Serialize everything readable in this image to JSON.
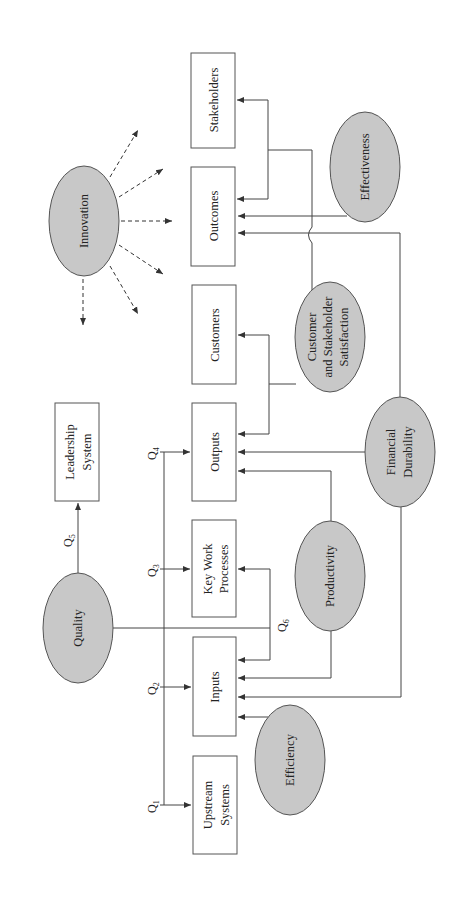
{
  "diagram": {
    "orientation": "rotated -90deg (landscape figure on portrait page)",
    "boxes": {
      "upstream": {
        "line1": "Upstream",
        "line2": "Systems"
      },
      "inputs": {
        "label": "Inputs"
      },
      "kwp": {
        "line1": "Key Work",
        "line2": "Processes"
      },
      "outputs": {
        "label": "Outputs"
      },
      "customers": {
        "label": "Customers"
      },
      "outcomes": {
        "label": "Outcomes"
      },
      "stakeholders": {
        "label": "Stakeholders"
      },
      "leadership": {
        "line1": "Leadership",
        "line2": "System"
      }
    },
    "ellipses": {
      "innovation": {
        "label": "Innovation"
      },
      "quality": {
        "label": "Quality"
      },
      "effectiveness": {
        "label": "Effectiveness"
      },
      "satisfaction": {
        "line1": "Customer",
        "line2": "and Stakeholder",
        "line3": "Satisfaction"
      },
      "financial": {
        "line1": "Financial",
        "line2": "Durability"
      },
      "productivity": {
        "label": "Productivity"
      },
      "efficiency": {
        "label": "Efficiency"
      }
    },
    "q_labels": {
      "q1": {
        "base": "Q",
        "sub": "1"
      },
      "q2": {
        "base": "Q",
        "sub": "2"
      },
      "q3": {
        "base": "Q",
        "sub": "3"
      },
      "q4": {
        "base": "Q",
        "sub": "4"
      },
      "q5": {
        "base": "Q",
        "sub": "5"
      },
      "q6": {
        "base": "Q",
        "sub": "6"
      }
    },
    "colors": {
      "ellipse_fill": "#c8c8c8",
      "stroke": "#555555",
      "background": "#ffffff"
    }
  }
}
